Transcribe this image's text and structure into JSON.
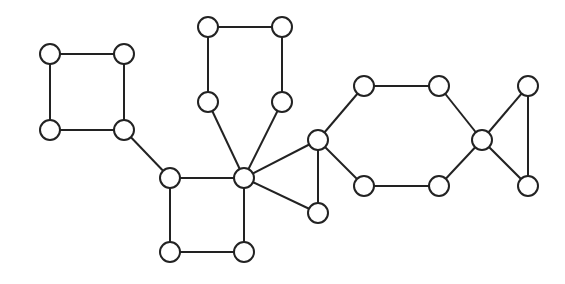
{
  "diagram": {
    "type": "undirected-graph",
    "node_radius": 10,
    "colors": {
      "stroke": "#222222",
      "fill": "#ffffff",
      "background": "#ffffff"
    },
    "nodes": [
      {
        "id": "A",
        "x": 50,
        "y": 54
      },
      {
        "id": "B",
        "x": 124,
        "y": 54
      },
      {
        "id": "C",
        "x": 50,
        "y": 130
      },
      {
        "id": "D",
        "x": 124,
        "y": 130
      },
      {
        "id": "E",
        "x": 208,
        "y": 27
      },
      {
        "id": "F",
        "x": 282,
        "y": 27
      },
      {
        "id": "G",
        "x": 208,
        "y": 102
      },
      {
        "id": "H",
        "x": 282,
        "y": 102
      },
      {
        "id": "I",
        "x": 170,
        "y": 178
      },
      {
        "id": "J",
        "x": 244,
        "y": 178
      },
      {
        "id": "K",
        "x": 170,
        "y": 252
      },
      {
        "id": "L",
        "x": 244,
        "y": 252
      },
      {
        "id": "M",
        "x": 318,
        "y": 140
      },
      {
        "id": "N",
        "x": 318,
        "y": 213
      },
      {
        "id": "O",
        "x": 364,
        "y": 86
      },
      {
        "id": "P",
        "x": 439,
        "y": 86
      },
      {
        "id": "Q",
        "x": 364,
        "y": 186
      },
      {
        "id": "R",
        "x": 439,
        "y": 186
      },
      {
        "id": "S",
        "x": 482,
        "y": 140
      },
      {
        "id": "T",
        "x": 528,
        "y": 86
      },
      {
        "id": "U",
        "x": 528,
        "y": 186
      }
    ],
    "edges": [
      [
        "A",
        "B"
      ],
      [
        "A",
        "C"
      ],
      [
        "B",
        "D"
      ],
      [
        "C",
        "D"
      ],
      [
        "D",
        "I"
      ],
      [
        "E",
        "F"
      ],
      [
        "E",
        "G"
      ],
      [
        "F",
        "H"
      ],
      [
        "G",
        "J"
      ],
      [
        "H",
        "J"
      ],
      [
        "I",
        "J"
      ],
      [
        "I",
        "K"
      ],
      [
        "J",
        "L"
      ],
      [
        "K",
        "L"
      ],
      [
        "J",
        "M"
      ],
      [
        "J",
        "N"
      ],
      [
        "M",
        "N"
      ],
      [
        "M",
        "O"
      ],
      [
        "M",
        "Q"
      ],
      [
        "O",
        "P"
      ],
      [
        "Q",
        "R"
      ],
      [
        "P",
        "S"
      ],
      [
        "R",
        "S"
      ],
      [
        "S",
        "T"
      ],
      [
        "S",
        "U"
      ],
      [
        "T",
        "U"
      ]
    ]
  }
}
